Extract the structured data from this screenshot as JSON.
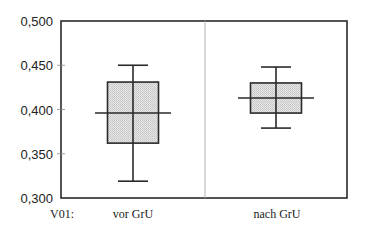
{
  "chart_data": {
    "type": "boxplot",
    "title": "",
    "xlabel": "",
    "ylabel": "",
    "row_label": "V01:",
    "categories": [
      "vor GrU",
      "nach GrU"
    ],
    "ylim": [
      0.3,
      0.5
    ],
    "yticks": [
      "0,300",
      "0,350",
      "0,400",
      "0,450",
      "0,500"
    ],
    "ytick_values": [
      0.3,
      0.35,
      0.4,
      0.45,
      0.5
    ],
    "grid": false,
    "legend": null,
    "series": [
      {
        "name": "vor GrU",
        "min": 0.319,
        "q1": 0.362,
        "median": 0.396,
        "q3": 0.431,
        "max": 0.45
      },
      {
        "name": "nach GrU",
        "min": 0.379,
        "q1": 0.396,
        "median": 0.413,
        "q3": 0.43,
        "max": 0.448
      }
    ],
    "colors": {
      "box_fill": "#d9d9d9",
      "lines": "#2a2a2a",
      "divider": "#b0b0b0"
    }
  }
}
